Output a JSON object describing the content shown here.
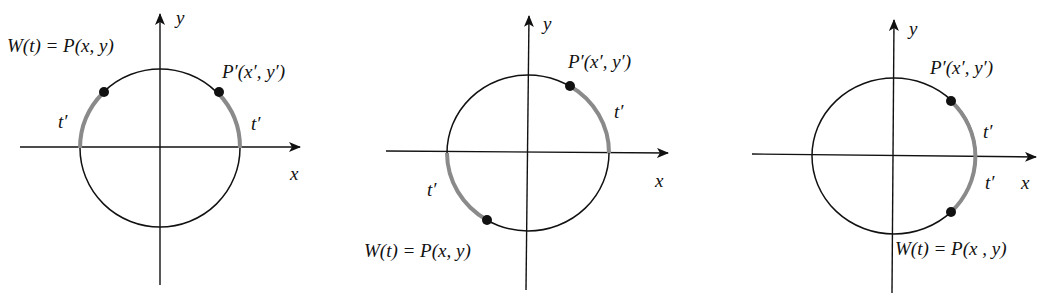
{
  "colors": {
    "ink": "#111111",
    "arc_highlight": "#8a8a8a",
    "background": "#ffffff"
  },
  "diagrams": [
    {
      "id": "diagram-1",
      "center": [
        160,
        147
      ],
      "radius": 80,
      "axis_x": {
        "from": 20,
        "to": 300,
        "y": 147,
        "label": "x"
      },
      "axis_y": {
        "from": 285,
        "to": 14,
        "x": 160,
        "label": "y"
      },
      "point_w": {
        "at": [
          103,
          93
        ],
        "label": "W(t) = P(x, y)"
      },
      "point_p": {
        "at": [
          218,
          93
        ],
        "label": "P′(x′, y′)"
      },
      "arc_labels": [
        "t′",
        "t′"
      ]
    },
    {
      "id": "diagram-2",
      "center": [
        528,
        152
      ],
      "radius": 80,
      "axis_x": {
        "from": 386,
        "to": 668,
        "y": 152,
        "label": "x"
      },
      "axis_y": {
        "from": 290,
        "to": 16,
        "x": 528,
        "label": "y"
      },
      "point_w": {
        "at": [
          487,
          220
        ],
        "label": "W(t) = P(x, y)"
      },
      "point_p": {
        "at": [
          570,
          85
        ],
        "label": "P′(x′, y′)"
      },
      "arc_labels": [
        "t′",
        "t′"
      ]
    },
    {
      "id": "diagram-3",
      "center": [
        893,
        155
      ],
      "radius": 82,
      "axis_x": {
        "from": 752,
        "to": 1036,
        "y": 155,
        "label": "x"
      },
      "axis_y": {
        "from": 293,
        "to": 20,
        "x": 893,
        "label": "y"
      },
      "point_w": {
        "at": [
          951,
          212
        ],
        "label": "W(t) = P(x , y)"
      },
      "point_p": {
        "at": [
          951,
          101
        ],
        "label": "P′(x′, y′)"
      },
      "arc_labels": [
        "t′",
        "t′"
      ]
    }
  ]
}
